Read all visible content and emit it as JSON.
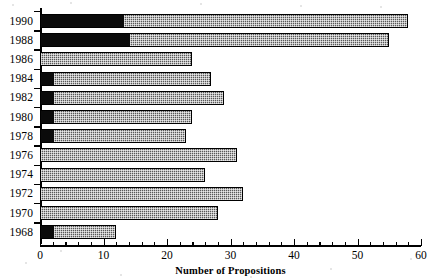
{
  "chart_data": {
    "type": "bar",
    "orientation": "horizontal",
    "stacked": true,
    "title": "",
    "xlabel": "Number of Propositions",
    "ylabel": "",
    "xlim": [
      0,
      60
    ],
    "ylim": null,
    "grid": false,
    "legend": null,
    "x_ticks_major": [
      0,
      10,
      20,
      30,
      40,
      50,
      60
    ],
    "x_tick_labels": [
      "0",
      "10",
      "20",
      "30",
      "40",
      "50",
      "60"
    ],
    "x_tick_minor_step": 2,
    "categories": [
      "1990",
      "1988",
      "1986",
      "1984",
      "1982",
      "1980",
      "1978",
      "1976",
      "1974",
      "1972",
      "1970",
      "1968"
    ],
    "series": [
      {
        "name": "dark-segment",
        "color": "#0b0b0b",
        "values": [
          13,
          14,
          0,
          2,
          2,
          2,
          2,
          0,
          0,
          0,
          0,
          2
        ]
      },
      {
        "name": "hatched-segment",
        "color": "#585858",
        "values": [
          45,
          41,
          24,
          25,
          27,
          22,
          21,
          31,
          26,
          32,
          28,
          10
        ]
      }
    ],
    "totals": [
      58,
      55,
      24,
      27,
      29,
      24,
      23,
      31,
      26,
      32,
      28,
      12
    ]
  },
  "axis": {
    "x_title": "Number of Propositions",
    "x_labels": [
      "0",
      "10",
      "20",
      "30",
      "40",
      "50",
      "60"
    ],
    "y_labels": [
      "1990",
      "1988",
      "1986",
      "1984",
      "1982",
      "1980",
      "1978",
      "1976",
      "1974",
      "1972",
      "1970",
      "1968"
    ]
  }
}
